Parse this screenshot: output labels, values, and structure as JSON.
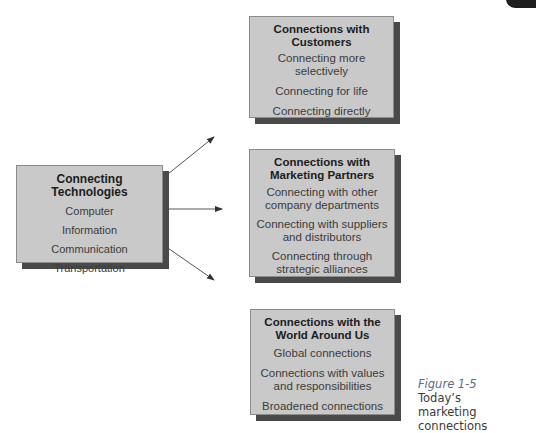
{
  "diagram": {
    "source_box": {
      "title": "Connecting Technologies",
      "items": [
        "Computer",
        "Information",
        "Communication",
        "Transportation"
      ]
    },
    "target_boxes": [
      {
        "title_line1": "Connections with",
        "title_line2": "Customers",
        "items": [
          [
            "Connecting more",
            "selectively"
          ],
          [
            "Connecting for life"
          ],
          [
            "Connecting directly"
          ]
        ]
      },
      {
        "title_line1": "Connections with",
        "title_line2": "Marketing Partners",
        "items": [
          [
            "Connecting with other",
            "company departments"
          ],
          [
            "Connecting with suppliers",
            "and distributors"
          ],
          [
            "Connecting through",
            "strategic alliances"
          ]
        ]
      },
      {
        "title_line1": "Connections with the",
        "title_line2": "World Around Us",
        "items": [
          [
            "Global connections"
          ],
          [
            "Connections with values",
            "and responsibilities"
          ],
          [
            "Broadened connections"
          ]
        ]
      }
    ],
    "arrows": [
      {
        "from": "source_box",
        "to": "target_boxes.0"
      },
      {
        "from": "source_box",
        "to": "target_boxes.1"
      },
      {
        "from": "source_box",
        "to": "target_boxes.2"
      }
    ]
  },
  "caption": {
    "figure_label": "Figure 1-5",
    "line1": "Today’s marketing",
    "line2": "connections"
  },
  "colors": {
    "box_fill": "#c9c9c9",
    "box_shadow": "#4a4a4a",
    "caption_label": "#5a6e86"
  }
}
